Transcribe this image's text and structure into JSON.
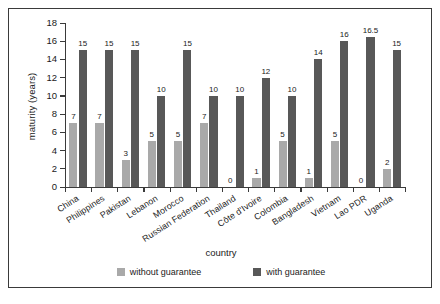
{
  "chart_data": {
    "type": "bar",
    "title": "",
    "xlabel": "country",
    "ylabel": "maturity (years)",
    "ylim": [
      0,
      18
    ],
    "yticks": [
      0,
      2,
      4,
      6,
      8,
      10,
      12,
      14,
      16,
      18
    ],
    "grid": false,
    "legend_position": "bottom",
    "categories": [
      "China",
      "Philippines",
      "Pakistan",
      "Lebanon",
      "Morocco",
      "Russian Federation",
      "Thailand",
      "Côte d'Ivoire",
      "Colombia",
      "Bangladesh",
      "Vietnam",
      "Lao PDR",
      "Uganda"
    ],
    "series": [
      {
        "name": "without guarantee",
        "color": "#a9a9a9",
        "values": [
          7,
          7,
          3,
          5,
          5,
          7,
          0,
          1,
          5,
          1,
          5,
          0,
          2
        ],
        "labels": [
          "7",
          "7",
          "3",
          "5",
          "5",
          "7",
          "0",
          "1",
          "5",
          "1",
          "5",
          "0",
          "2"
        ]
      },
      {
        "name": "with guarantee",
        "color": "#585858",
        "values": [
          15,
          15,
          15,
          10,
          15,
          10,
          10,
          12,
          10,
          14,
          16,
          16.5,
          15
        ],
        "labels": [
          "15",
          "15",
          "15",
          "10",
          "15",
          "10",
          "10",
          "12",
          "10",
          "14",
          "16",
          "16.5",
          "15"
        ]
      }
    ]
  },
  "legend": {
    "items": [
      {
        "label": "without guarantee",
        "color": "#a9a9a9"
      },
      {
        "label": "with guarantee",
        "color": "#585858"
      }
    ]
  }
}
